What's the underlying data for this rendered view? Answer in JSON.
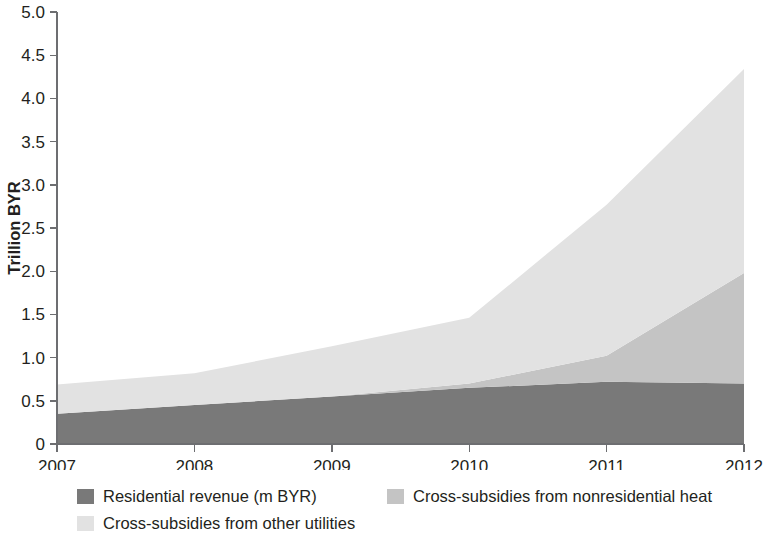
{
  "chart_data": {
    "type": "area",
    "stacked": true,
    "title": "",
    "subtitle": "",
    "xlabel": "",
    "ylabel": "Trillion BYR",
    "x": [
      2007,
      2008,
      2009,
      2010,
      2011,
      2012
    ],
    "categories": [
      "2007",
      "2008",
      "2009",
      "2010",
      "2011",
      "2012"
    ],
    "xtick_labels": [
      "2007",
      "2008",
      "2009",
      "2010",
      "2011",
      "2012"
    ],
    "ytick_labels": [
      "0",
      "0.5",
      "1.0",
      "1.5",
      "2.0",
      "2.5",
      "3.0",
      "3.5",
      "4.0",
      "4.5",
      "5.0"
    ],
    "ytick_values": [
      0,
      0.5,
      1.0,
      1.5,
      2.0,
      2.5,
      3.0,
      3.5,
      4.0,
      4.5,
      5.0
    ],
    "ylim": [
      0,
      5.0
    ],
    "xlim": [
      2007,
      2012
    ],
    "grid": false,
    "legend_position": "bottom-left",
    "series": [
      {
        "name": "Residential revenue (m BYR)",
        "color": "#797979",
        "values": [
          0.35,
          0.45,
          0.55,
          0.65,
          0.72,
          0.7
        ]
      },
      {
        "name": "Cross-subsidies from nonresidential heat",
        "color": "#c4c4c4",
        "values": [
          0.0,
          0.0,
          0.0,
          0.05,
          0.3,
          1.28
        ]
      },
      {
        "name": "Cross-subsidies from other utilities",
        "color": "#e2e2e2",
        "values": [
          0.34,
          0.37,
          0.58,
          0.76,
          1.75,
          2.36
        ]
      }
    ],
    "cumulative_tops": {
      "residential": [
        0.35,
        0.45,
        0.55,
        0.65,
        0.72,
        0.7
      ],
      "plus_nonresidential_heat": [
        0.35,
        0.45,
        0.55,
        0.7,
        1.02,
        1.98
      ],
      "plus_other_utilities": [
        0.69,
        0.82,
        1.13,
        1.46,
        2.77,
        4.34
      ]
    }
  },
  "legend": {
    "items": [
      {
        "label": "Residential revenue (m BYR)",
        "color": "#797979"
      },
      {
        "label": "Cross-subsidies from nonresidential heat",
        "color": "#c4c4c4"
      },
      {
        "label": "Cross-subsidies from other utilities",
        "color": "#e2e2e2"
      }
    ]
  },
  "axes": {
    "y_title": "Trillion BYR"
  }
}
